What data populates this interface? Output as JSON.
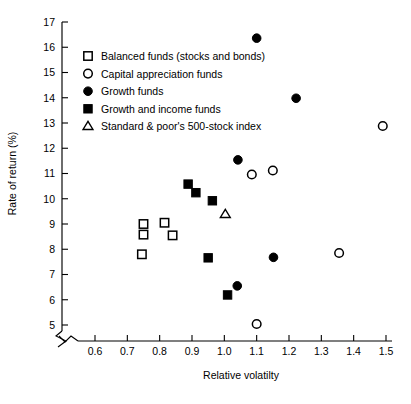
{
  "chart_data": {
    "type": "scatter",
    "title": "",
    "xlabel": "Relative volatilty",
    "ylabel": "Rate of return (%)",
    "xlim": [
      0.55,
      1.52
    ],
    "ylim": [
      4.55,
      17.0
    ],
    "xticks": [
      "0.6",
      "0.7",
      "0.8",
      "0.9",
      "1.0",
      "1.1",
      "1.2",
      "1.3",
      "1.4",
      "1.5"
    ],
    "xtick_values": [
      0.6,
      0.7,
      0.8,
      0.9,
      1.0,
      1.1,
      1.2,
      1.3,
      1.4,
      1.5
    ],
    "yticks": [
      "5",
      "6",
      "7",
      "8",
      "9",
      "10",
      "11",
      "12",
      "13",
      "14",
      "15",
      "16",
      "17"
    ],
    "ytick_values": [
      5,
      6,
      7,
      8,
      9,
      10,
      11,
      12,
      13,
      14,
      15,
      16,
      17
    ],
    "grid": false,
    "axis_break_x": true,
    "axis_break_y": true,
    "legend_position": "upper-left-inside",
    "marker_color": "#000000",
    "series": [
      {
        "name": "Balanced funds (stocks and bonds)",
        "marker": "open-square",
        "points": [
          {
            "x": 0.75,
            "y": 9.0
          },
          {
            "x": 0.75,
            "y": 8.58
          },
          {
            "x": 0.745,
            "y": 7.8
          },
          {
            "x": 0.815,
            "y": 9.05
          },
          {
            "x": 0.84,
            "y": 8.55
          }
        ]
      },
      {
        "name": "Capital appreciation funds",
        "marker": "open-circle",
        "points": [
          {
            "x": 1.49,
            "y": 12.88
          },
          {
            "x": 1.085,
            "y": 10.96
          },
          {
            "x": 1.15,
            "y": 11.12
          },
          {
            "x": 1.355,
            "y": 7.85
          },
          {
            "x": 1.1,
            "y": 5.04
          }
        ]
      },
      {
        "name": "Growth funds",
        "marker": "filled-circle",
        "points": [
          {
            "x": 1.1,
            "y": 16.36
          },
          {
            "x": 1.222,
            "y": 13.98
          },
          {
            "x": 1.042,
            "y": 11.54
          },
          {
            "x": 1.152,
            "y": 7.68
          },
          {
            "x": 1.04,
            "y": 6.55
          }
        ]
      },
      {
        "name": "Growth and income funds",
        "marker": "filled-square",
        "points": [
          {
            "x": 0.888,
            "y": 10.58
          },
          {
            "x": 0.912,
            "y": 10.24
          },
          {
            "x": 0.963,
            "y": 9.92
          },
          {
            "x": 0.95,
            "y": 7.66
          },
          {
            "x": 1.01,
            "y": 6.19
          }
        ]
      },
      {
        "name": "Standard & poor's 500-stock index",
        "marker": "open-triangle",
        "points": [
          {
            "x": 1.003,
            "y": 9.38
          }
        ]
      }
    ]
  },
  "legend": {
    "items": [
      {
        "marker": "open-square",
        "label": "Balanced funds (stocks and bonds)"
      },
      {
        "marker": "open-circle",
        "label": "Capital appreciation funds"
      },
      {
        "marker": "filled-circle",
        "label": "Growth funds"
      },
      {
        "marker": "filled-square",
        "label": "Growth and income funds"
      },
      {
        "marker": "open-triangle",
        "label": "Standard & poor's 500-stock index"
      }
    ]
  }
}
